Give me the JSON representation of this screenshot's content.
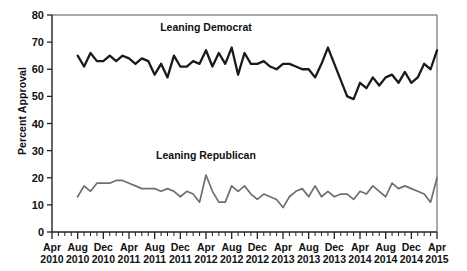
{
  "chart_data": {
    "type": "line",
    "title": "",
    "xlabel": "",
    "ylabel": "Percent Approval",
    "ylim": [
      0,
      80
    ],
    "ytick_values": [
      0,
      10,
      20,
      30,
      40,
      50,
      60,
      70,
      80
    ],
    "ytick_labels": [
      "0",
      "10",
      "20",
      "30",
      "40",
      "50",
      "60",
      "70",
      "80"
    ],
    "grid": false,
    "legend_position": "inline-annotation",
    "x_axis_unit": "month",
    "x_start": "Apr 2010",
    "x_end": "Apr 2015",
    "xtick_months": [
      "Apr",
      "Aug",
      "Dec",
      "Apr",
      "Aug",
      "Dec",
      "Apr",
      "Aug",
      "Dec",
      "Apr",
      "Aug",
      "Dec",
      "Apr",
      "Aug",
      "Dec",
      "Apr"
    ],
    "xtick_years": [
      "2010",
      "2010",
      "2010",
      "2011",
      "2011",
      "2011",
      "2012",
      "2012",
      "2012",
      "2013",
      "2013",
      "2013",
      "2014",
      "2014",
      "2014",
      "2015"
    ],
    "annotations": [
      {
        "name": "leaning-democrat-label",
        "text": "Leaning Democrat",
        "x_month": "Apr 2012",
        "y": 74
      },
      {
        "name": "leaning-republican-label",
        "text": "Leaning Republican",
        "x_month": "Apr 2012",
        "y": 27
      }
    ],
    "series": [
      {
        "name": "Leaning Democrat",
        "color": "#1a1a1a",
        "line_width": 2.3,
        "x_labels": [
          "Aug 2010",
          "Sep 2010",
          "Oct 2010",
          "Nov 2010",
          "Dec 2010",
          "Jan 2011",
          "Feb 2011",
          "Mar 2011",
          "Apr 2011",
          "May 2011",
          "Jun 2011",
          "Jul 2011",
          "Aug 2011",
          "Sep 2011",
          "Oct 2011",
          "Nov 2011",
          "Dec 2011",
          "Jan 2012",
          "Feb 2012",
          "Mar 2012",
          "Apr 2012",
          "May 2012",
          "Jun 2012",
          "Jul 2012",
          "Aug 2012",
          "Sep 2012",
          "Oct 2012",
          "Nov 2012",
          "Dec 2012",
          "Jan 2013",
          "Feb 2013",
          "Mar 2013",
          "Apr 2013",
          "May 2013",
          "Jun 2013",
          "Jul 2013",
          "Aug 2013",
          "Sep 2013",
          "Oct 2013",
          "Nov 2013",
          "Dec 2013",
          "Jan 2014",
          "Feb 2014",
          "Mar 2014",
          "Apr 2014",
          "May 2014",
          "Jun 2014",
          "Jul 2014",
          "Aug 2014",
          "Sep 2014",
          "Oct 2014",
          "Nov 2014",
          "Dec 2014",
          "Jan 2015",
          "Feb 2015",
          "Mar 2015",
          "Apr 2015"
        ],
        "values": [
          65,
          61,
          66,
          63,
          63,
          65,
          63,
          65,
          64,
          62,
          64,
          63,
          58,
          62,
          57,
          65,
          61,
          61,
          63,
          62,
          67,
          61,
          66,
          62,
          68,
          58,
          66,
          62,
          62,
          63,
          61,
          60,
          62,
          62,
          61,
          60,
          60,
          57,
          62,
          68,
          62,
          56,
          50,
          49,
          55,
          53,
          57,
          54,
          57,
          58,
          55,
          59,
          55,
          57,
          62,
          60,
          67
        ]
      },
      {
        "name": "Leaning Republican",
        "color": "#6e6e6e",
        "line_width": 1.7,
        "x_labels": [
          "Aug 2010",
          "Sep 2010",
          "Oct 2010",
          "Nov 2010",
          "Dec 2010",
          "Jan 2011",
          "Feb 2011",
          "Mar 2011",
          "Apr 2011",
          "May 2011",
          "Jun 2011",
          "Jul 2011",
          "Aug 2011",
          "Sep 2011",
          "Oct 2011",
          "Nov 2011",
          "Dec 2011",
          "Jan 2012",
          "Feb 2012",
          "Mar 2012",
          "Apr 2012",
          "May 2012",
          "Jun 2012",
          "Jul 2012",
          "Aug 2012",
          "Sep 2012",
          "Oct 2012",
          "Nov 2012",
          "Dec 2012",
          "Jan 2013",
          "Feb 2013",
          "Mar 2013",
          "Apr 2013",
          "May 2013",
          "Jun 2013",
          "Jul 2013",
          "Aug 2013",
          "Sep 2013",
          "Oct 2013",
          "Nov 2013",
          "Dec 2013",
          "Jan 2014",
          "Feb 2014",
          "Mar 2014",
          "Apr 2014",
          "May 2014",
          "Jun 2014",
          "Jul 2014",
          "Aug 2014",
          "Sep 2014",
          "Oct 2014",
          "Nov 2014",
          "Dec 2014",
          "Jan 2015",
          "Feb 2015",
          "Mar 2015",
          "Apr 2015"
        ],
        "values": [
          13,
          17,
          15,
          18,
          18,
          18,
          19,
          19,
          18,
          17,
          16,
          16,
          16,
          15,
          16,
          15,
          13,
          15,
          14,
          11,
          21,
          15,
          11,
          11,
          17,
          15,
          17,
          14,
          12,
          14,
          13,
          12,
          9,
          13,
          15,
          16,
          13,
          17,
          13,
          15,
          13,
          14,
          14,
          12,
          15,
          14,
          17,
          15,
          13,
          18,
          16,
          17,
          16,
          15,
          14,
          11,
          20
        ]
      }
    ]
  }
}
